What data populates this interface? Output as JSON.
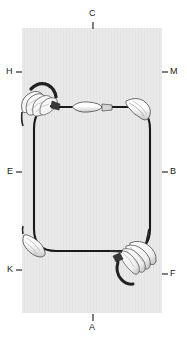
{
  "figure": {
    "background_color": "#ffffff",
    "panel_color": "#e8e8e8",
    "line_color": "#1a1a1a",
    "panel": {
      "x": 22,
      "y": 28,
      "width": 140,
      "height": 285
    }
  },
  "labels": [
    {
      "id": "C",
      "text": "C",
      "x": 88,
      "y": 13,
      "tick": "below",
      "position": "top-center"
    },
    {
      "id": "M",
      "text": "M",
      "x": 172,
      "y": 70,
      "tick": "left",
      "position": "upper-right"
    },
    {
      "id": "H",
      "text": "H",
      "x": 8,
      "y": 70,
      "tick": "right",
      "position": "upper-left"
    },
    {
      "id": "B",
      "text": "B",
      "x": 171,
      "y": 170,
      "tick": "left",
      "position": "mid-right"
    },
    {
      "id": "E",
      "text": "E",
      "x": 9,
      "y": 170,
      "tick": "right",
      "position": "mid-left"
    },
    {
      "id": "F",
      "text": "F",
      "x": 172,
      "y": 272,
      "tick": "left",
      "position": "lower-right"
    },
    {
      "id": "K",
      "text": "K",
      "x": 9,
      "y": 268,
      "tick": "right",
      "position": "lower-left"
    },
    {
      "id": "A",
      "text": "A",
      "x": 88,
      "y": 327,
      "tick": "above",
      "position": "bottom-center"
    }
  ],
  "loop": {
    "description": "closed rounded-rectangle wire loop with four corner fixtures",
    "top_y": 107,
    "bottom_y": 251,
    "left_x": 34,
    "right_x": 150,
    "corner_radius": 18
  },
  "features": [
    {
      "name": "top-left-claw-assembly",
      "x": 26,
      "y": 78,
      "kind": "multi-finger-clamp"
    },
    {
      "name": "top-right-sleeve",
      "x": 133,
      "y": 95,
      "kind": "tapered-sleeve"
    },
    {
      "name": "top-edge-sleeve",
      "x": 78,
      "y": 101,
      "kind": "tapered-sleeve"
    },
    {
      "name": "bottom-left-sleeve",
      "x": 24,
      "y": 237,
      "kind": "tapered-sleeve"
    },
    {
      "name": "bottom-right-claw-assembly",
      "x": 124,
      "y": 240,
      "kind": "multi-finger-clamp"
    }
  ]
}
